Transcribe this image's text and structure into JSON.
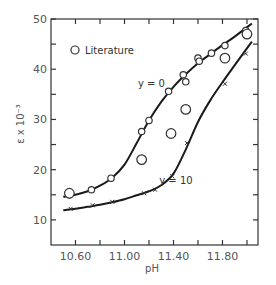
{
  "chart_data": {
    "type": "line",
    "title": "",
    "xlabel": "pH",
    "ylabel": "ε x 10⁻³",
    "xlim": [
      10.4,
      12.09
    ],
    "ylim": [
      5,
      50
    ],
    "x_ticks": [
      10.6,
      10.8,
      11.0,
      11.2,
      11.4,
      11.6,
      11.8,
      12.0
    ],
    "x_tick_labels": [
      "10.60",
      "",
      "11.00",
      "",
      "11.40",
      "",
      "11.80",
      ""
    ],
    "y_ticks": [
      10,
      15,
      20,
      25,
      30,
      35,
      40,
      45,
      50
    ],
    "y_tick_labels": [
      "10",
      "",
      "20",
      "",
      "30",
      "",
      "40",
      "",
      "50"
    ],
    "grid": false,
    "legend": {
      "position": "top-left",
      "entries": [
        {
          "marker": "circle",
          "label": "Literature"
        }
      ]
    },
    "series": [
      {
        "name": "y=0",
        "label": "y = 0",
        "marker": "circle",
        "curve": {
          "x": [
            10.5,
            10.6,
            10.7,
            10.8,
            10.9,
            11.0,
            11.1,
            11.2,
            11.3,
            11.4,
            11.5,
            11.6,
            11.7,
            11.8,
            11.9,
            12.04
          ],
          "y": [
            14.6,
            15.0,
            15.7,
            16.8,
            18.4,
            21.0,
            25.3,
            29.8,
            33.5,
            36.5,
            39.0,
            41.2,
            43.0,
            44.8,
            46.5,
            49.1
          ]
        },
        "points": {
          "x": [
            10.55,
            10.73,
            10.89,
            11.14,
            11.2,
            11.36,
            11.48,
            11.5,
            11.6,
            11.61,
            11.71,
            11.82,
            11.99
          ],
          "y": [
            15.0,
            16.0,
            18.3,
            27.6,
            29.8,
            35.6,
            38.9,
            37.5,
            42.2,
            41.6,
            43.2,
            44.7,
            47.7
          ]
        }
      },
      {
        "name": "y=10",
        "label": "y = 10",
        "marker": "x",
        "curve": {
          "x": [
            10.5,
            10.6,
            10.7,
            10.8,
            10.9,
            11.0,
            11.1,
            11.2,
            11.3,
            11.4,
            11.5,
            11.6,
            11.7,
            11.8,
            11.9,
            12.04
          ],
          "y": [
            11.9,
            12.2,
            12.6,
            13.0,
            13.5,
            14.1,
            14.9,
            15.7,
            16.9,
            19.2,
            24.0,
            29.5,
            33.8,
            37.4,
            40.8,
            45.5
          ]
        },
        "points": {
          "x": [
            10.56,
            10.74,
            10.9,
            11.16,
            11.25,
            11.39,
            11.51,
            11.82,
            11.99
          ],
          "y": [
            12.2,
            12.9,
            13.6,
            15.3,
            16.0,
            18.7,
            25.3,
            37.1,
            43.1
          ]
        }
      },
      {
        "name": "Literature",
        "marker": "circle-large",
        "points": {
          "x": [
            10.55,
            11.14,
            11.38,
            11.5,
            11.82,
            12.0
          ],
          "y": [
            15.3,
            22.0,
            27.2,
            32.0,
            42.2,
            47.0
          ]
        }
      }
    ],
    "annotations": [
      {
        "text": "y = 0",
        "x": 11.22,
        "y": 36.5
      },
      {
        "text": "y = 10",
        "x": 11.42,
        "y": 17.2
      }
    ]
  }
}
